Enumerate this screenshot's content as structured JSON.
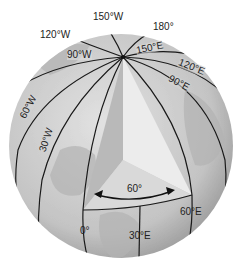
{
  "diagram": {
    "type": "globe-meridians",
    "colors": {
      "globe_base": "#cfcfcf",
      "globe_shade": "#a9a9a9",
      "wedge_left": "#bdbdbd",
      "wedge_right": "#e6e6e6",
      "wedge_bottom": "#d6d6d6",
      "lines": "#1a1a1a"
    },
    "angle_label": "60°",
    "meridian_labels": {
      "w150": "150°W",
      "e180": "180°",
      "w120": "120°W",
      "w90": "90°W",
      "e150": "150°E",
      "e120": "120°E",
      "e90": "90°E",
      "w60": "60°W",
      "w30": "30°W",
      "e60": "60°E",
      "zero": "0°",
      "e30": "30°E"
    }
  }
}
